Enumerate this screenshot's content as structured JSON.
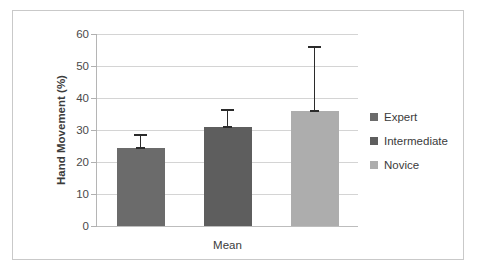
{
  "chart_data": {
    "type": "bar",
    "title": "",
    "xlabel": "Mean",
    "ylabel": "Hand Movement (%)",
    "categories": [
      "Mean"
    ],
    "ylim": [
      0,
      60
    ],
    "ytick_labels": [
      "60",
      "50",
      "40",
      "30",
      "20",
      "10",
      "0"
    ],
    "ytick_values": [
      60,
      50,
      40,
      30,
      20,
      10,
      0
    ],
    "grid": true,
    "legend_position": "right",
    "series": [
      {
        "name": "Expert",
        "values": [
          24.3
        ],
        "error_upper": [
          4.0
        ],
        "error_top_value": 28.3,
        "color": "#6b6b6b"
      },
      {
        "name": "Intermediate",
        "values": [
          31.0
        ],
        "error_upper": [
          5.3
        ],
        "error_top_value": 36.3,
        "color": "#5e5e5e"
      },
      {
        "name": "Novice",
        "values": [
          36.0
        ],
        "error_upper": [
          20.0
        ],
        "error_top_value": 56.0,
        "color": "#adadad"
      }
    ]
  },
  "axis": {
    "y_title": "Hand Movement (%)",
    "x_title": "Mean",
    "ticks": [
      {
        "label": "60"
      },
      {
        "label": "50"
      },
      {
        "label": "40"
      },
      {
        "label": "30"
      },
      {
        "label": "20"
      },
      {
        "label": "10"
      },
      {
        "label": "0"
      }
    ]
  },
  "legend": {
    "items": [
      {
        "label": "Expert",
        "color": "#6b6b6b"
      },
      {
        "label": "Intermediate",
        "color": "#5e5e5e"
      },
      {
        "label": "Novice",
        "color": "#adadad"
      }
    ]
  },
  "colors": {
    "expert": "#6b6b6b",
    "intermediate": "#5e5e5e",
    "novice": "#adadad",
    "gridline": "#d4d4d4",
    "axis": "#b5b5b5",
    "error": "#2b2b2b",
    "frame": "#c9c9c9",
    "background": "#ffffff"
  }
}
